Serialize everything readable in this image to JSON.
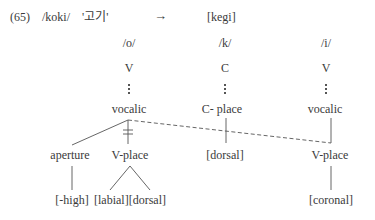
{
  "example": {
    "number": "(65)",
    "input_form": "/koki/",
    "gloss": "'고기'",
    "arrow": "→",
    "output_form": "[kegi]"
  },
  "segments": [
    {
      "phoneme": "/o/",
      "skeletal": "V",
      "node": "vocalic"
    },
    {
      "phoneme": "/k/",
      "skeletal": "C",
      "node": "C- place"
    },
    {
      "phoneme": "/i/",
      "skeletal": "V",
      "node": "vocalic"
    }
  ],
  "tree": {
    "o": {
      "children": [
        "aperture",
        "V-place"
      ],
      "aperture_feature": "[-high]",
      "vplace_features": "[labial][dorsal]",
      "delink_mark": "ǂ"
    },
    "k": {
      "feature": "[dorsal]"
    },
    "i": {
      "child": "V-place",
      "feature": "[coronal]"
    }
  },
  "colors": {
    "ink": "#3a3a3a",
    "line": "#555555"
  }
}
